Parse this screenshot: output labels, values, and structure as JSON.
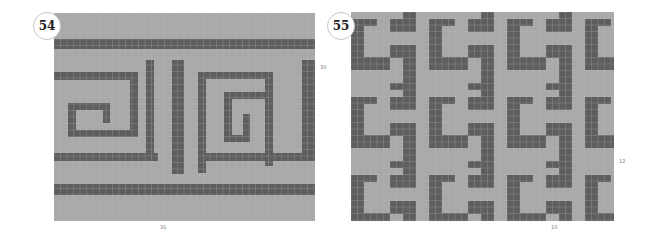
{
  "colors": {
    "background": "#ffffff",
    "light_cell": "#a9a9a9",
    "dark_cell": "#5e5e5e",
    "grid_line": "#bdbdbd",
    "badge_border": "#c8c8c8"
  },
  "charts": [
    {
      "number": "54",
      "width_label": "31",
      "height_label": "30",
      "panel": {
        "x": 54,
        "y": 13,
        "w": 261,
        "h": 208
      },
      "cell": 6.5,
      "dark_rects": [
        [
          0,
          26,
          261,
          10
        ],
        [
          0,
          171,
          261,
          11
        ],
        [
          0,
          59,
          83,
          8
        ],
        [
          76,
          59,
          8,
          65
        ],
        [
          14,
          117,
          70,
          7
        ],
        [
          14,
          90,
          8,
          34
        ],
        [
          14,
          90,
          42,
          7
        ],
        [
          49,
          90,
          7,
          20
        ],
        [
          0,
          140,
          104,
          8
        ],
        [
          92,
          47,
          8,
          93
        ],
        [
          118,
          47,
          12,
          114
        ],
        [
          144,
          59,
          8,
          101
        ],
        [
          144,
          59,
          75,
          7
        ],
        [
          211,
          59,
          8,
          94
        ],
        [
          170,
          79,
          49,
          7
        ],
        [
          170,
          79,
          8,
          50
        ],
        [
          170,
          122,
          26,
          7
        ],
        [
          189,
          101,
          7,
          28
        ],
        [
          144,
          140,
          117,
          8
        ],
        [
          248,
          47,
          13,
          101
        ],
        [
          144,
          153,
          117,
          0
        ]
      ]
    },
    {
      "number": "55",
      "width_label": "10",
      "height_label": "12",
      "panel": {
        "x": 351,
        "y": 12,
        "w": 263,
        "h": 209
      },
      "cell": 6.5,
      "tile": {
        "w": 78,
        "h": 78
      },
      "tile_dark_rects": [
        [
          13,
          0,
          13,
          20
        ],
        [
          0,
          7,
          26,
          13
        ],
        [
          39,
          7,
          26,
          7
        ],
        [
          39,
          7,
          13,
          51
        ],
        [
          39,
          45,
          39,
          13
        ],
        [
          0,
          33,
          26,
          13
        ],
        [
          13,
          33,
          13,
          51
        ],
        [
          0,
          71,
          26,
          7
        ]
      ]
    }
  ]
}
